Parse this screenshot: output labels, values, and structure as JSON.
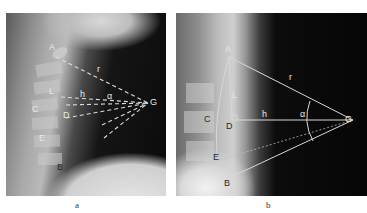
{
  "figure": {
    "panels": [
      {
        "id": "a",
        "caption": "a",
        "labels": {
          "A": "A",
          "B": "B",
          "C": "C",
          "D": "D",
          "E": "E",
          "L": "L",
          "G": "G",
          "r": "r",
          "h": "h",
          "alpha": "α"
        }
      },
      {
        "id": "b",
        "caption": "b",
        "labels": {
          "A": "A",
          "B": "B",
          "C": "C",
          "D": "D",
          "E": "E",
          "L": "L",
          "G": "G",
          "r": "r",
          "h": "h",
          "alpha": "α"
        }
      }
    ]
  }
}
